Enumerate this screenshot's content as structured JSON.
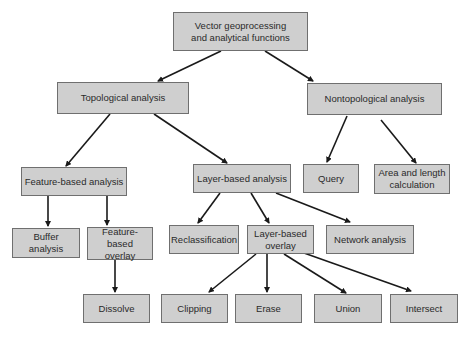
{
  "diagram": {
    "type": "hierarchy-tree",
    "colors": {
      "box_fill": "#cfcfcf",
      "box_border": "#6f6f6f",
      "arrow": "#1a1a1a",
      "background": "#ffffff"
    },
    "nodes": [
      {
        "id": "root",
        "label": "Vector geoprocessing and analytical functions",
        "lines": [
          "Vector geoprocessing",
          "and analytical functions"
        ],
        "box": [
          173,
          12,
          135,
          39
        ]
      },
      {
        "id": "topo",
        "label": "Topological analysis",
        "lines": [
          "Topological analysis"
        ],
        "box": [
          57,
          82,
          132,
          32
        ]
      },
      {
        "id": "nontopo",
        "label": "Nontopological analysis",
        "lines": [
          "Nontopological analysis"
        ],
        "box": [
          307,
          83,
          135,
          32
        ]
      },
      {
        "id": "feat",
        "label": "Feature-based analysis",
        "lines": [
          "Feature-based analysis"
        ],
        "box": [
          21,
          167,
          106,
          29
        ]
      },
      {
        "id": "layer",
        "label": "Layer-based analysis",
        "lines": [
          "Layer-based analysis"
        ],
        "box": [
          193,
          164,
          98,
          29
        ]
      },
      {
        "id": "query",
        "label": "Query",
        "lines": [
          "Query"
        ],
        "box": [
          303,
          164,
          56,
          29
        ]
      },
      {
        "id": "area",
        "label": "Area and length calculation",
        "lines": [
          "Area and length",
          "calculation"
        ],
        "box": [
          374,
          164,
          76,
          30
        ]
      },
      {
        "id": "buffer",
        "label": "Buffer analysis",
        "lines": [
          "Buffer analysis"
        ],
        "box": [
          12,
          228,
          68,
          30
        ]
      },
      {
        "id": "featover",
        "label": "Feature-based overlay",
        "lines": [
          "Feature-based",
          "overlay"
        ],
        "box": [
          87,
          227,
          66,
          33
        ]
      },
      {
        "id": "reclass",
        "label": "Reclassification",
        "lines": [
          "Reclassification"
        ],
        "box": [
          169,
          225,
          70,
          29
        ]
      },
      {
        "id": "layerover",
        "label": "Layer-based overlay",
        "lines": [
          "Layer-based",
          "overlay"
        ],
        "box": [
          247,
          225,
          67,
          29
        ]
      },
      {
        "id": "network",
        "label": "Network analysis",
        "lines": [
          "Network analysis"
        ],
        "box": [
          326,
          225,
          88,
          29
        ]
      },
      {
        "id": "dissolve",
        "label": "Dissolve",
        "lines": [
          "Dissolve"
        ],
        "box": [
          83,
          294,
          67,
          29
        ]
      },
      {
        "id": "clipping",
        "label": "Clipping",
        "lines": [
          "Clipping"
        ],
        "box": [
          161,
          294,
          67,
          29
        ]
      },
      {
        "id": "erase",
        "label": "Erase",
        "lines": [
          "Erase"
        ],
        "box": [
          235,
          294,
          67,
          29
        ]
      },
      {
        "id": "union",
        "label": "Union",
        "lines": [
          "Union"
        ],
        "box": [
          314,
          294,
          68,
          29
        ]
      },
      {
        "id": "intersect",
        "label": "Intersect",
        "lines": [
          "Intersect"
        ],
        "box": [
          390,
          294,
          68,
          29
        ]
      }
    ],
    "edges": [
      {
        "from": "root",
        "to": "topo",
        "points": [
          221,
          51,
          158,
          81
        ]
      },
      {
        "from": "root",
        "to": "nontopo",
        "points": [
          265,
          51,
          313,
          81
        ]
      },
      {
        "from": "topo",
        "to": "feat",
        "points": [
          110,
          114,
          66,
          166
        ]
      },
      {
        "from": "topo",
        "to": "layer",
        "points": [
          154,
          114,
          227,
          163
        ]
      },
      {
        "from": "nontopo",
        "to": "query",
        "points": [
          347,
          116,
          327,
          162
        ]
      },
      {
        "from": "nontopo",
        "to": "area",
        "points": [
          381,
          120,
          416,
          163
        ]
      },
      {
        "from": "feat",
        "to": "buffer",
        "points": [
          48,
          196,
          48,
          226
        ]
      },
      {
        "from": "feat",
        "to": "featover",
        "points": [
          107,
          196,
          107,
          225
        ]
      },
      {
        "from": "featover",
        "to": "dissolve",
        "points": [
          115,
          260,
          115,
          292
        ]
      },
      {
        "from": "layer",
        "to": "reclass",
        "points": [
          220,
          193,
          198,
          223
        ]
      },
      {
        "from": "layer",
        "to": "layerover",
        "points": [
          251,
          193,
          269,
          223
        ]
      },
      {
        "from": "layer",
        "to": "network",
        "points": [
          276,
          193,
          350,
          222
        ]
      },
      {
        "from": "layerover",
        "to": "clipping",
        "points": [
          256,
          254,
          209,
          292
        ]
      },
      {
        "from": "layerover",
        "to": "erase",
        "points": [
          267,
          254,
          267,
          292
        ]
      },
      {
        "from": "layerover",
        "to": "union",
        "points": [
          284,
          254,
          346,
          293
        ]
      },
      {
        "from": "layerover",
        "to": "intersect",
        "points": [
          304,
          253,
          411,
          291
        ]
      }
    ]
  }
}
